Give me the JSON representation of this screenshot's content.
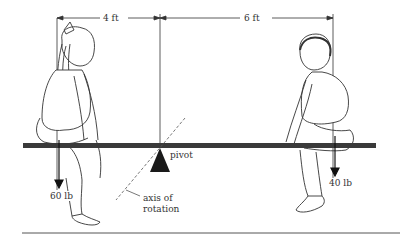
{
  "diagram": {
    "dimensions": {
      "left_distance": "4 ft",
      "right_distance": "6 ft"
    },
    "forces": {
      "left_weight": "60 lb",
      "right_weight": "40 lb"
    },
    "labels": {
      "pivot": "pivot",
      "axis_line1": "axis of",
      "axis_line2": "rotation"
    },
    "figures": {
      "left": "girl",
      "right": "boy"
    },
    "colors": {
      "ink": "#222222",
      "board": "#3a3a3a",
      "background": "#ffffff"
    }
  }
}
